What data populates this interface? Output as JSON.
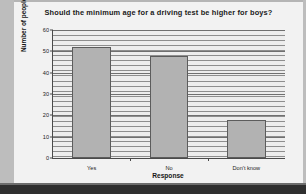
{
  "chart_data": {
    "type": "bar",
    "title": "Should the minimum age for a driving test be higher for boys?",
    "xlabel": "Response",
    "ylabel": "Number of people",
    "categories": [
      "Yes",
      "No",
      "Don't know"
    ],
    "values": [
      52,
      48,
      18
    ],
    "ylim": [
      0,
      60
    ],
    "ytick_labels": [
      "0",
      "10",
      "20",
      "30",
      "40",
      "50",
      "60"
    ],
    "ytick_values": [
      0,
      10,
      20,
      30,
      40,
      50,
      60
    ],
    "grid": "horizontal",
    "legend": "none",
    "bar_fill_color": "#b2b2b2",
    "bar_edge_color": "#5c5c5c",
    "plot_background_color": "#ededed",
    "gridline_color": "#8e8e8e",
    "axis_color": "#4a4a4a",
    "text_color": "#1a1a1a"
  }
}
